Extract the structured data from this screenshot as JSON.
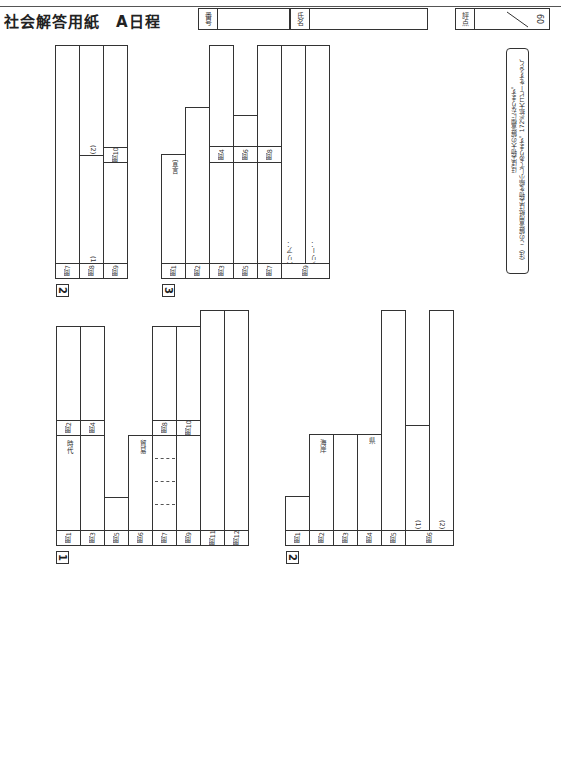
{
  "header": {
    "title": "社会解答用紙",
    "schedule": "A日程",
    "student_number_label": "番号",
    "name_label": "氏名",
    "score_label": "評点",
    "score_total": "60"
  },
  "note": {
    "line1": "（注）この解答用紙は実物を縮小してあります。172%拡大コピーをすると、",
    "line2": "ほぼ実物大の解答欄になります。"
  },
  "sections": {
    "s1": {
      "number": "1",
      "questions": [
        "問1",
        "問2",
        "問3",
        "問4",
        "問5",
        "問6",
        "問7",
        "問8",
        "問9",
        "問10",
        "問11",
        "問12"
      ],
      "suffix_jidai": "時代",
      "suffix_boeki": "貿易"
    },
    "s2a": {
      "number": "2",
      "questions": [
        "問1",
        "問2",
        "問3",
        "問4",
        "問5",
        "問6"
      ],
      "suffix_kaigan": "海岸",
      "suffix_ken": "県",
      "sub1": "(1)",
      "sub2": "(2)"
    },
    "s2b": {
      "number": "2",
      "questions": [
        "問7",
        "問8",
        "問9",
        "問10"
      ],
      "sub1": "(1)",
      "sub2": "(2)"
    },
    "s3": {
      "number": "3",
      "questions": [
        "問1",
        "問2",
        "問3",
        "問4",
        "問5",
        "問6",
        "問7",
        "問8",
        "問9"
      ],
      "suffix_sengen": "宣言",
      "barrier": "バリア：",
      "free": "フリー："
    }
  }
}
